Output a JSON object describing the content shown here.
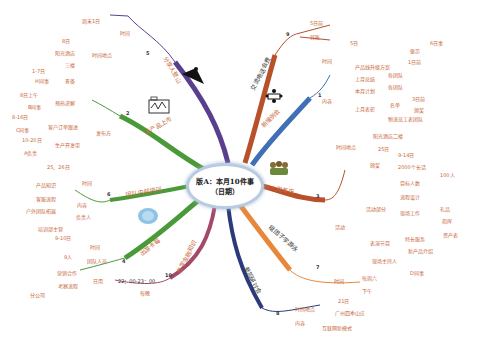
{
  "center": {
    "line1": "版A：本月10件事",
    "line2": "（日期）"
  },
  "branches": {
    "b1": {
      "num": "1",
      "title": "新增例会",
      "color": "#3f6fb5",
      "time_label": "时间",
      "time_value": "5日",
      "content_label": "内容",
      "plan_label": "产品线升级方案",
      "plan_a": "驱示",
      "plan_a_val": "6日事",
      "plan_b": "1日前",
      "last_month_label": "上月总结",
      "last_month_val": "各团队",
      "this_month_label": "本月计划",
      "this_month_val": "各团队",
      "last_month_people_label": "上月表彰",
      "people_a": "名单",
      "people_a1": "3日前",
      "people_a2": "颁奖",
      "people_b": "物流员工表团队"
    },
    "b2": {
      "num": "2",
      "title": "新产品上市",
      "color": "#4a9a3a",
      "time_place_label": "时间地点",
      "tp1": "8日",
      "tp2": "阳光酒店",
      "tp3": "三楼",
      "publish_label": "发布方",
      "prep_label": "筹备",
      "prep_date": "1-7日",
      "prep_team": "H同事",
      "plan_label": "预热讲解",
      "plan_date": "8日上午",
      "plan_team": "B同事",
      "order_label": "客户订单跟进",
      "order_date": "8-16日",
      "order_team": "C同事",
      "prod_label": "生产开发带",
      "prod_date": "10-20日",
      "prod_team": "A负责"
    },
    "b3": {
      "num": "3",
      "title": "年会",
      "branch_title": "十六周年庆",
      "color": "#c8683a",
      "tp_label": "时间地点",
      "tp1": "阳光酒店二楼",
      "tp2": "25日",
      "activity_label": "活动",
      "pre_label": "颁奖",
      "pre1": "9-14日",
      "pre2": "2000个长话",
      "event_label": "活动部分",
      "ev1_label": "目标人数",
      "ev1_val": "100人",
      "ev2_label": "流程设计",
      "ev3_label": "现场工作",
      "ev3_a": "礼品",
      "ev3_b": "指挥",
      "show_label": "表演节目",
      "show_a": "特长服务",
      "show_a_val": "资产表",
      "show_b": "新产品介绍",
      "host_label": "现场主持人",
      "host_val": "D同事"
    },
    "b4": {
      "num": "4",
      "title": "出游卡莓",
      "color": "#4a9a3a",
      "time_label": "时间",
      "time_value": "9-10日",
      "people_label": "团队人员",
      "people_value": "9人",
      "cost_label": "日用",
      "cost_a": "营销合作",
      "cost_b": "考察流程",
      "cost_c": "分公司"
    },
    "b5": {
      "num": "5",
      "title": "分享人登山",
      "color": "#5b3f8f",
      "time_label": "时间",
      "time_value": "周末1日"
    },
    "b6": {
      "num": "6",
      "title": "团队内部培训",
      "color": "#4a9a3a",
      "time_label": "时间",
      "time_value": "25、26日",
      "content_label": "内容",
      "c1": "产品知识",
      "c2": "客服流程",
      "c3": "户外团队拓展",
      "owner_label": "负责人",
      "owner_value": "培训部主管"
    },
    "b7": {
      "num": "7",
      "title": "组团子学游泳",
      "color": "#e8873a",
      "time_label": "时间",
      "time_value": "每周六",
      "time_sub": "下午"
    },
    "b8": {
      "num": "8",
      "title": "参加研讨会",
      "color": "#2a3a7a",
      "tp_label": "时间地点",
      "tp1": "21日",
      "tp2": "广州四季山庄",
      "content_label": "内容",
      "content_value": "互联网新模式"
    },
    "b9": {
      "num": "9",
      "title": "交流电话会费",
      "color": "#b8502a",
      "a": "5日前",
      "b": "转账"
    },
    "b10": {
      "num": "10",
      "title": "自学金融知识",
      "color": "#a34a6a",
      "time_value": "22：00-23：00",
      "freq": "每晚"
    }
  }
}
